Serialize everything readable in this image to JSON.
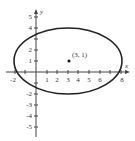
{
  "diagram": {
    "type": "ellipse-plot",
    "axes": {
      "x_label": "x",
      "y_label": "y",
      "x_ticks": [
        "-2",
        "1",
        "2",
        "3",
        "4",
        "5",
        "6",
        "8"
      ],
      "y_ticks_pos": [
        "5",
        "4",
        "2",
        "1"
      ],
      "y_ticks_neg": [
        "-2",
        "-3",
        "-4",
        "-5"
      ],
      "x_range": [
        -2,
        8
      ],
      "y_range": [
        -5,
        5
      ]
    },
    "ellipse": {
      "center": [
        3,
        1
      ],
      "semi_major_x": 5,
      "semi_minor_y": 3
    },
    "point": {
      "label": "(3, 1)",
      "coords": [
        3,
        1
      ]
    },
    "colors": {
      "stroke": "#222222",
      "axis": "#444444"
    }
  }
}
